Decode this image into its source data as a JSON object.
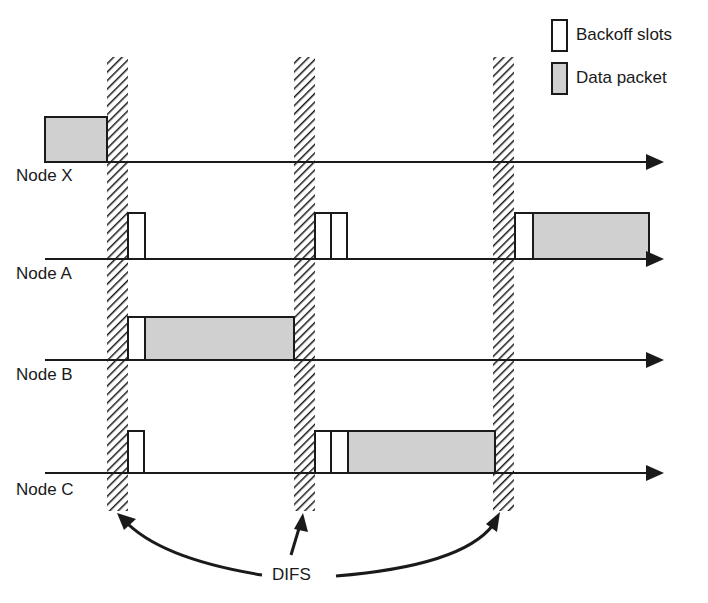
{
  "legend": {
    "backoff_label": "Backoff slots",
    "data_label": "Data packet"
  },
  "nodes": [
    {
      "label": "Node X"
    },
    {
      "label": "Node A"
    },
    {
      "label": "Node B"
    },
    {
      "label": "Node C"
    }
  ],
  "annotation": {
    "difs_label": "DIFS"
  },
  "colors": {
    "line": "#1a1a1a",
    "data_fill": "#d0d0d0",
    "backoff_fill": "#ffffff",
    "hatch": "#1a1a1a"
  }
}
